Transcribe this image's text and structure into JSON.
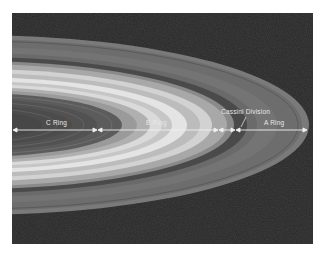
{
  "figure": {
    "labels": {
      "c_ring": "C Ring",
      "b_ring": "B Ring",
      "cassini_division": "Cassini Division",
      "a_ring": "A Ring"
    },
    "colors": {
      "background_space": "#262626",
      "annotation": "#f0f0f0"
    }
  }
}
